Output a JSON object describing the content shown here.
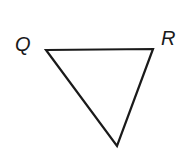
{
  "diagram": {
    "type": "triangle",
    "vertices": [
      {
        "label": "Q",
        "x": 46,
        "y": 50
      },
      {
        "label": "R",
        "x": 153,
        "y": 49
      },
      {
        "label": "",
        "x": 117,
        "y": 146
      }
    ],
    "labels": {
      "q": "Q",
      "r": "R"
    },
    "stroke_color": "#1a1a1a",
    "background": "#ffffff"
  }
}
